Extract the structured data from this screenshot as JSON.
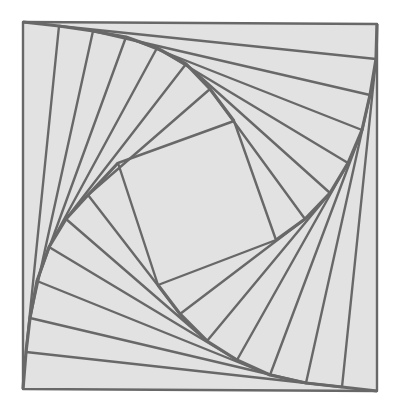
{
  "diagram": {
    "title": "",
    "colors": {
      "background": "#ffffff",
      "fill": "#e2e2e2",
      "stroke": "#686868"
    },
    "stroke_width": 2.4,
    "chains": {
      "top_left": [
        [
          23,
          22
        ],
        [
          59,
          26
        ],
        [
          93,
          31
        ],
        [
          126,
          37
        ],
        [
          157,
          48
        ],
        [
          186,
          64
        ],
        [
          210,
          89
        ],
        [
          234,
          121
        ]
      ],
      "top_right": [
        [
          377,
          24
        ],
        [
          376,
          59
        ],
        [
          370,
          95
        ],
        [
          362,
          130
        ],
        [
          348,
          163
        ],
        [
          330,
          193
        ],
        [
          305,
          219
        ],
        [
          276,
          240
        ]
      ],
      "bottom_right": [
        [
          377,
          391
        ],
        [
          342,
          387
        ],
        [
          306,
          383
        ],
        [
          270,
          375
        ],
        [
          237,
          360
        ],
        [
          207,
          341
        ],
        [
          180,
          314
        ],
        [
          158,
          285
        ]
      ],
      "bottom_left": [
        [
          23,
          389
        ],
        [
          26,
          352
        ],
        [
          30,
          318
        ],
        [
          37,
          281
        ],
        [
          49,
          247
        ],
        [
          66,
          219
        ],
        [
          88,
          195
        ],
        [
          118,
          163
        ]
      ]
    }
  }
}
